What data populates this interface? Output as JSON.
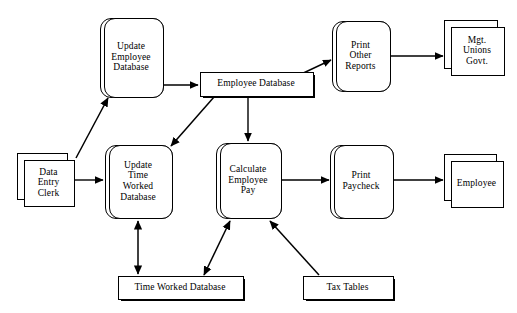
{
  "diagram": {
    "type": "data-flow-diagram",
    "width": 517,
    "height": 313,
    "background_color": "#ffffff",
    "line_color": "#000000",
    "text_color": "#000000",
    "nodes": [
      {
        "id": "update-employee-database",
        "kind": "process",
        "label": "Update\nEmployee\nDatabase",
        "x": 100,
        "y": 18,
        "w": 62,
        "h": 78
      },
      {
        "id": "employee-database",
        "kind": "data-store",
        "label": "Employee Database",
        "x": 200,
        "y": 72,
        "w": 112,
        "h": 23
      },
      {
        "id": "print-other-reports",
        "kind": "process",
        "label": "Print\nOther\nReports",
        "x": 332,
        "y": 21,
        "w": 57,
        "h": 69
      },
      {
        "id": "mgt-unions-govt",
        "kind": "external-entity",
        "label": "Mgt.\nUnions\nGovt.",
        "x": 444,
        "y": 20,
        "w": 59,
        "h": 54
      },
      {
        "id": "data-entry-clerk",
        "kind": "external-entity",
        "label": "Data\nEntry\nClerk",
        "x": 17,
        "y": 153,
        "w": 56,
        "h": 52
      },
      {
        "id": "update-time-worked-database",
        "kind": "process",
        "label": "Update\nTime\nWorked\nDatabase",
        "x": 105,
        "y": 145,
        "w": 66,
        "h": 72
      },
      {
        "id": "calculate-employee-pay",
        "kind": "process",
        "label": "Calculate\nEmployee\nPay",
        "x": 216,
        "y": 143,
        "w": 64,
        "h": 74
      },
      {
        "id": "print-paycheck",
        "kind": "process",
        "label": "Print\nPaycheck",
        "x": 330,
        "y": 145,
        "w": 62,
        "h": 72
      },
      {
        "id": "employee",
        "kind": "external-entity",
        "label": "Employee",
        "x": 444,
        "y": 154,
        "w": 58,
        "h": 52
      },
      {
        "id": "time-worked-database",
        "kind": "data-store",
        "label": "Time Worked Database",
        "x": 118,
        "y": 276,
        "w": 124,
        "h": 22
      },
      {
        "id": "tax-tables",
        "kind": "data-store",
        "label": "Tax Tables",
        "x": 303,
        "y": 276,
        "w": 89,
        "h": 22
      }
    ],
    "edges": [
      {
        "id": "clerk-to-update-employee-db",
        "from": "data-entry-clerk",
        "to": "update-employee-database",
        "arrowheads": "end",
        "points": "76,158 108,98"
      },
      {
        "id": "update-employee-db-to-employee-db",
        "from": "update-employee-database",
        "to": "employee-database",
        "arrowheads": "end",
        "points": "162,85 198,85"
      },
      {
        "id": "employee-db-to-print-other-reports",
        "from": "employee-database",
        "to": "print-other-reports",
        "arrowheads": "end",
        "points": "298,75 331,60"
      },
      {
        "id": "print-other-reports-to-mgt",
        "from": "print-other-reports",
        "to": "mgt-unions-govt",
        "arrowheads": "end",
        "points": "392,56 443,56"
      },
      {
        "id": "employee-db-to-update-time-worked",
        "from": "employee-database",
        "to": "update-time-worked-database",
        "arrowheads": "end",
        "points": "214,97 170,145"
      },
      {
        "id": "employee-db-to-calculate-pay",
        "from": "employee-database",
        "to": "calculate-employee-pay",
        "arrowheads": "end",
        "points": "248,97 248,141"
      },
      {
        "id": "clerk-to-update-time-worked",
        "from": "data-entry-clerk",
        "to": "update-time-worked-database",
        "arrowheads": "end",
        "points": "75,180 103,180"
      },
      {
        "id": "update-time-worked-to-store",
        "from": "update-time-worked-database",
        "to": "time-worked-database",
        "arrowheads": "both",
        "points": "138,220 138,274"
      },
      {
        "id": "time-worked-store-to-calculate-pay",
        "from": "time-worked-database",
        "to": "calculate-employee-pay",
        "arrowheads": "both",
        "points": "205,274 229,221"
      },
      {
        "id": "tax-tables-to-calculate-pay",
        "from": "tax-tables",
        "to": "calculate-employee-pay",
        "arrowheads": "end",
        "points": "318,274 271,221"
      },
      {
        "id": "calculate-pay-to-print-paycheck",
        "from": "calculate-employee-pay",
        "to": "print-paycheck",
        "arrowheads": "end",
        "points": "281,180 329,180"
      },
      {
        "id": "print-paycheck-to-employee",
        "from": "print-paycheck",
        "to": "employee",
        "arrowheads": "end",
        "points": "393,180 443,180"
      }
    ]
  }
}
